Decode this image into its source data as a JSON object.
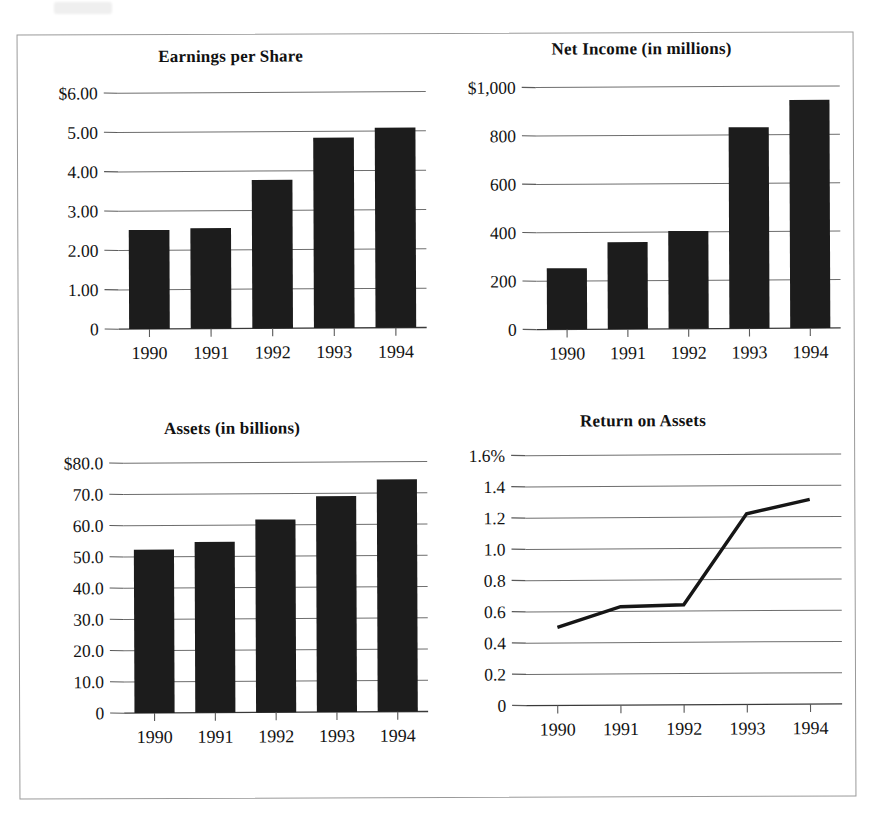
{
  "figure": {
    "panels": [
      "Earnings per Share",
      "Net Income (in millions)",
      "Assets (in billions)",
      "Return on Assets"
    ],
    "frame_color": "#9a9a9a",
    "bar_color": "#1c1c1c",
    "line_color": "#161616",
    "grid_color": "#6e6e6e"
  },
  "chart_data": [
    {
      "type": "bar",
      "id": "earnings-per-share",
      "title": "Earnings per Share",
      "categories": [
        "1990",
        "1991",
        "1992",
        "1993",
        "1994"
      ],
      "values": [
        2.52,
        2.56,
        3.78,
        4.85,
        5.1
      ],
      "ytick_labels": [
        "$6.00",
        "5.00",
        "4.00",
        "3.00",
        "2.00",
        "1.00",
        "0"
      ],
      "ytick_values": [
        6,
        5,
        4,
        3,
        2,
        1,
        0
      ],
      "ylim": [
        0,
        6
      ],
      "xlabel": "",
      "ylabel": "",
      "grid": true,
      "legend": "none"
    },
    {
      "type": "bar",
      "id": "net-income",
      "title": "Net Income (in millions)",
      "categories": [
        "1990",
        "1991",
        "1992",
        "1993",
        "1994"
      ],
      "values": [
        253,
        360,
        405,
        833,
        945
      ],
      "ytick_labels": [
        "$1,000",
        "800",
        "600",
        "400",
        "200",
        "0"
      ],
      "ytick_values": [
        1000,
        800,
        600,
        400,
        200,
        0
      ],
      "ylim": [
        0,
        1000
      ],
      "xlabel": "",
      "ylabel": "",
      "grid": true,
      "legend": "none"
    },
    {
      "type": "bar",
      "id": "assets",
      "title": "Assets (in billions)",
      "categories": [
        "1990",
        "1991",
        "1992",
        "1993",
        "1994"
      ],
      "values": [
        52.3,
        54.7,
        61.8,
        69.2,
        74.5
      ],
      "ytick_labels": [
        "$80.0",
        "70.0",
        "60.0",
        "50.0",
        "40.0",
        "30.0",
        "20.0",
        "10.0",
        "0"
      ],
      "ytick_values": [
        80,
        70,
        60,
        50,
        40,
        30,
        20,
        10,
        0
      ],
      "ylim": [
        0,
        80
      ],
      "xlabel": "",
      "ylabel": "",
      "grid": true,
      "legend": "none"
    },
    {
      "type": "line",
      "id": "return-on-assets",
      "title": "Return on Assets",
      "categories": [
        "1990",
        "1991",
        "1992",
        "1993",
        "1994"
      ],
      "values": [
        0.5,
        0.63,
        0.64,
        1.22,
        1.31
      ],
      "ytick_labels": [
        "1.6%",
        "1.4",
        "1.2",
        "1.0",
        "0.8",
        "0.6",
        "0.4",
        "0.2",
        "0"
      ],
      "ytick_values": [
        1.6,
        1.4,
        1.2,
        1.0,
        0.8,
        0.6,
        0.4,
        0.2,
        0
      ],
      "ylim": [
        0,
        1.6
      ],
      "xlabel": "",
      "ylabel": "",
      "grid": true,
      "legend": "none"
    }
  ]
}
